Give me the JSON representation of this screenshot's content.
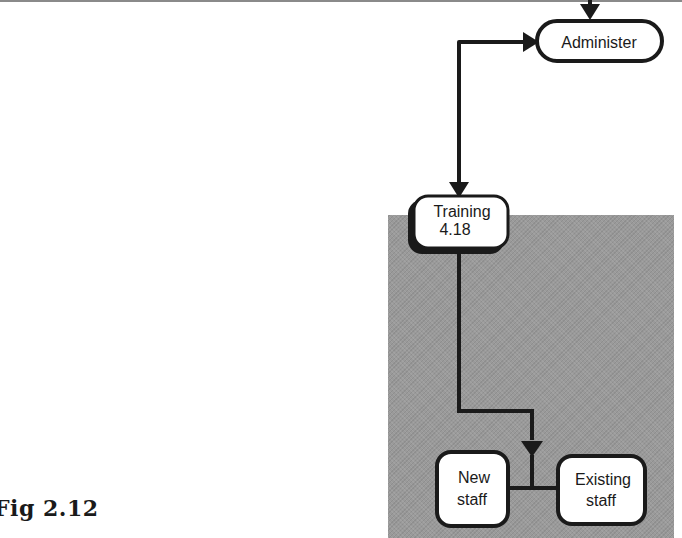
{
  "figure": {
    "label": "Fig 2.12"
  },
  "nodes": {
    "administer": {
      "label": "Administer"
    },
    "training": {
      "line1": "Training",
      "line2": "4.18"
    },
    "new_staff": {
      "line1": "New",
      "line2": "staff"
    },
    "existing_staff": {
      "line1": "Existing",
      "line2": "staff"
    }
  },
  "colors": {
    "line": "#1a1a1a",
    "panel": "#9a9a9a",
    "node_fill": "#ffffff"
  }
}
